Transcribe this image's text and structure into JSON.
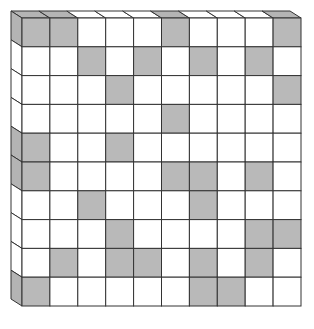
{
  "diagram": {
    "type": "3d-grid-board",
    "rows": 10,
    "cols": 10,
    "front_face": {
      "x": 22,
      "y": 18,
      "width": 279,
      "height": 288
    },
    "extrusion": {
      "dx": -11,
      "dy": -7
    },
    "colors": {
      "background": "#ffffff",
      "empty": "#ffffff",
      "shaded": "#b9b9b9",
      "side_shaded": "#b4b4b4",
      "line": "#333333"
    },
    "shaded_cells": [
      [
        0,
        1,
        5,
        9
      ],
      [
        2,
        4,
        6,
        8
      ],
      [
        3,
        9
      ],
      [
        5
      ],
      [
        0,
        3
      ],
      [
        0,
        5,
        6,
        8
      ],
      [
        2,
        6
      ],
      [
        3,
        8,
        9
      ],
      [
        1,
        3,
        4,
        6,
        8
      ],
      [
        0,
        6,
        7
      ]
    ]
  }
}
